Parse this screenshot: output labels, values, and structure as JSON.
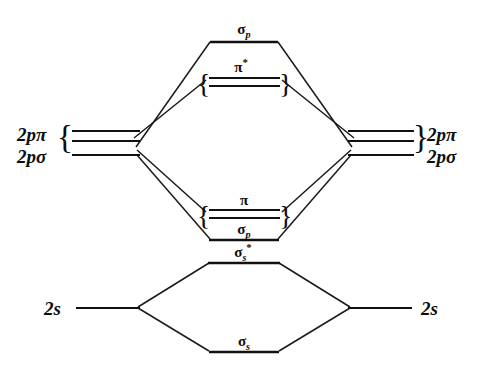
{
  "figure": {
    "kind": "molecular-orbital-energy-level-diagram",
    "title": "",
    "background_color": "#ffffff",
    "line_color": "#111111",
    "text_color": "#0d0d0d"
  },
  "atomic_orbitals": {
    "left": [
      {
        "id": "left-2p-pi",
        "label_greek": "π",
        "label_prefix": "2p",
        "brace": "{",
        "degeneracy": 2
      },
      {
        "id": "left-2p-sigma",
        "label_greek": "σ",
        "label_prefix": "2p",
        "brace": "",
        "degeneracy": 1
      },
      {
        "id": "left-2s",
        "label_greek": "",
        "label_prefix": "2s",
        "brace": "",
        "degeneracy": 1
      }
    ],
    "right": [
      {
        "id": "right-2p-pi",
        "label_greek": "π",
        "label_prefix": "2p",
        "brace": "}",
        "degeneracy": 2
      },
      {
        "id": "right-2p-sigma",
        "label_greek": "σ",
        "label_prefix": "2p",
        "brace": "",
        "degeneracy": 1
      },
      {
        "id": "right-2s",
        "label_greek": "",
        "label_prefix": "2s",
        "brace": "",
        "degeneracy": 1
      }
    ],
    "labels": {
      "two_p_pi": "2pπ",
      "two_p_sigma": "2pσ",
      "two_s": "2s"
    }
  },
  "molecular_orbitals": [
    {
      "id": "mo-sigma-p-antibonding",
      "symbol_base": "σ",
      "subscript": "p",
      "superscript": "",
      "label_text": "σp",
      "degeneracy": 1,
      "braced": false,
      "energy_rank": 1,
      "character": "antibonding"
    },
    {
      "id": "mo-pi-star",
      "symbol_base": "π",
      "subscript": "",
      "superscript": "*",
      "label_text": "π*",
      "degeneracy": 2,
      "braced": true,
      "energy_rank": 2,
      "character": "antibonding"
    },
    {
      "id": "mo-pi-bonding",
      "symbol_base": "π",
      "subscript": "",
      "superscript": "",
      "label_text": "π",
      "degeneracy": 2,
      "braced": true,
      "energy_rank": 3,
      "character": "bonding"
    },
    {
      "id": "mo-sigma-p-bonding",
      "symbol_base": "σ",
      "subscript": "p",
      "superscript": "",
      "label_text": "σp",
      "degeneracy": 1,
      "braced": false,
      "energy_rank": 4,
      "character": "bonding"
    },
    {
      "id": "mo-sigma-s-star",
      "symbol_base": "σ",
      "subscript": "s",
      "superscript": "*",
      "label_text": "σs*",
      "degeneracy": 1,
      "braced": false,
      "energy_rank": 5,
      "character": "antibonding"
    },
    {
      "id": "mo-sigma-s-bonding",
      "symbol_base": "σ",
      "subscript": "s",
      "superscript": "",
      "label_text": "σs",
      "degeneracy": 1,
      "braced": false,
      "energy_rank": 6,
      "character": "bonding"
    }
  ],
  "glyphs": {
    "sigma": "σ",
    "pi": "π",
    "asterisk": "*",
    "brace_open": "{",
    "brace_close": "}",
    "digit_two": "2",
    "letter_p": "p",
    "letter_s": "s"
  }
}
